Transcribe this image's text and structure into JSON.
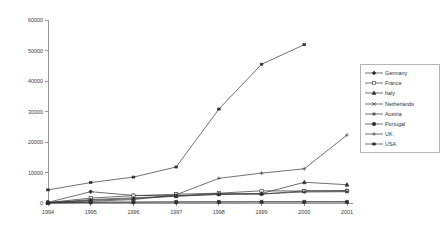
{
  "chart_data": {
    "type": "line",
    "title": "",
    "xlabel": "",
    "ylabel": "",
    "categories": [
      "1994",
      "1995",
      "1996",
      "1997",
      "1998",
      "1999",
      "2000",
      "2001"
    ],
    "ylim": [
      0,
      60000
    ],
    "yticks": [
      "0",
      "10000",
      "20000",
      "30000",
      "40000",
      "50000",
      "60000"
    ],
    "ytick_values": [
      0,
      10000,
      20000,
      30000,
      40000,
      50000,
      60000
    ],
    "grid": false,
    "legend_position": "right",
    "series": [
      {
        "name": "Germany",
        "marker": "filled-diamond",
        "values": [
          200,
          3700,
          2500,
          2400,
          3100,
          2900,
          4000,
          4100
        ]
      },
      {
        "name": "France",
        "marker": "open-square",
        "values": [
          150,
          1600,
          2400,
          2900,
          3200,
          4000,
          3900,
          3900
        ]
      },
      {
        "name": "Italy",
        "marker": "filled-triangle",
        "values": [
          100,
          900,
          1400,
          2200,
          2900,
          3100,
          6800,
          6000
        ]
      },
      {
        "name": "Netherlands",
        "marker": "cross-x",
        "values": [
          60,
          250,
          300,
          350,
          400,
          420,
          430,
          450
        ]
      },
      {
        "name": "Austria",
        "marker": "asterisk",
        "values": [
          80,
          1100,
          1700,
          2300,
          2800,
          3000,
          3600,
          3700
        ]
      },
      {
        "name": "Portugal",
        "marker": "filled-circle",
        "values": [
          40,
          200,
          250,
          280,
          300,
          320,
          330,
          340
        ]
      },
      {
        "name": "UK",
        "marker": "plus",
        "values": [
          120,
          600,
          1100,
          2700,
          8100,
          9800,
          11200,
          22300
        ]
      },
      {
        "name": "USA",
        "marker": "small-dash",
        "values": [
          4300,
          6700,
          8500,
          11800,
          30800,
          45500,
          51900,
          null
        ]
      }
    ]
  },
  "legend": {
    "items": [
      {
        "label": "Germany"
      },
      {
        "label": "France"
      },
      {
        "label": "Italy"
      },
      {
        "label": "Netherlands"
      },
      {
        "label": "Austria"
      },
      {
        "label": "Portugal"
      },
      {
        "label": "UK"
      },
      {
        "label": "USA"
      }
    ]
  }
}
